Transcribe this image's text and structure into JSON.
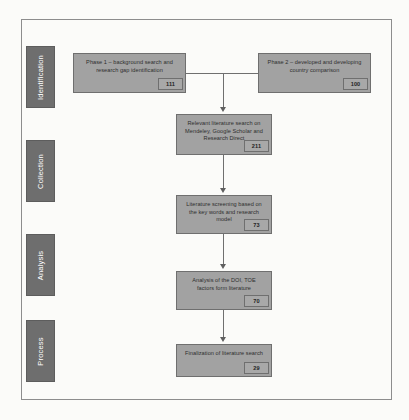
{
  "figure": {
    "stages": [
      {
        "id": "identification",
        "label": "Identification"
      },
      {
        "id": "collection",
        "label": "Collection"
      },
      {
        "id": "analysis",
        "label": "Analysis"
      },
      {
        "id": "process",
        "label": "Process"
      }
    ],
    "boxes": [
      {
        "id": "phase1",
        "text": "Phase 1 – background search and research gap identification",
        "count": "111"
      },
      {
        "id": "phase2",
        "text": "Phase 2 – developed and developing country comparison",
        "count": "100"
      },
      {
        "id": "search",
        "text": "Relevant literature search on Mendeley, Google Scholar and Research Direct",
        "count": "211"
      },
      {
        "id": "screening",
        "text": "Literature screening based on the key words and research model",
        "count": "73"
      },
      {
        "id": "analysis",
        "text": "Analysis of the DOI, TOE factors form literature",
        "count": "70"
      },
      {
        "id": "final",
        "text": "Finalization of literature search",
        "count": "29"
      }
    ],
    "colors": {
      "box_fill": "#a2a2a2",
      "box_border": "#6f6f6f",
      "stage_fill": "#6e6e6e",
      "connector": "#6f6f6f",
      "page_background": "#fbfbf9"
    }
  }
}
